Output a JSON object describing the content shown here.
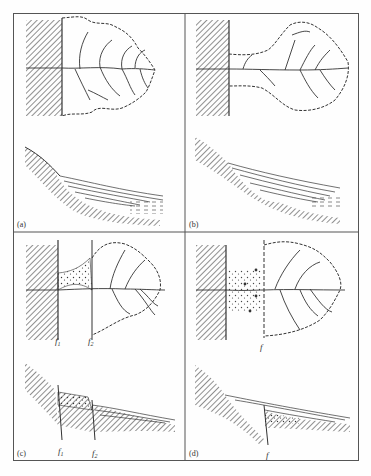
{
  "figure": {
    "type": "four-panel geological diagram",
    "panels": [
      {
        "id": "a",
        "label": "(a)",
        "fault_labels": []
      },
      {
        "id": "b",
        "label": "(b)",
        "fault_labels": []
      },
      {
        "id": "c",
        "label": "(c)",
        "fault_labels": [
          "f1",
          "f2"
        ]
      },
      {
        "id": "d",
        "label": "(d)",
        "fault_labels": [
          "f"
        ]
      }
    ],
    "fault_text": {
      "c_f1_base": "f",
      "c_f1_sub": "1",
      "c_f2_base": "f",
      "c_f2_sub": "2",
      "d_f": "f"
    },
    "colors": {
      "frame": "#555555",
      "ink": "#333333",
      "background": "#fefefe"
    }
  }
}
